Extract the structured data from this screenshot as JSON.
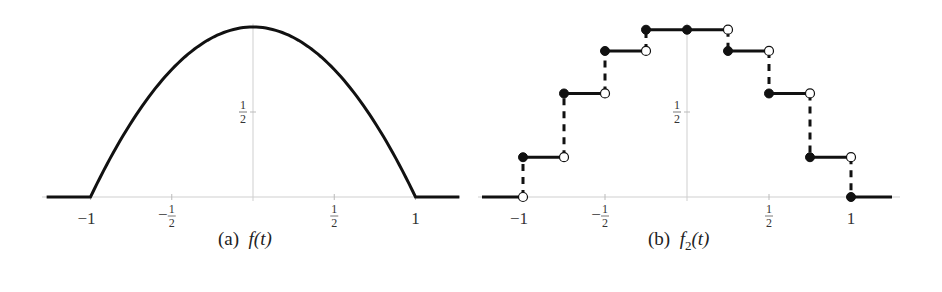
{
  "chart_data": [
    {
      "type": "line",
      "title": "(a) f(t)",
      "caption_label": "(a)",
      "caption_func": "f(t)",
      "xlabel": "",
      "ylabel": "",
      "xlim": [
        -1.25,
        1.25
      ],
      "ylim": [
        0,
        1
      ],
      "x_ticks": [
        "−1",
        "−1/2",
        "1/2",
        "1"
      ],
      "x_tick_values": [
        -1,
        -0.5,
        0.5,
        1
      ],
      "y_ticks": [
        "1/2"
      ],
      "y_tick_values": [
        0.5
      ],
      "grid": false,
      "series": [
        {
          "name": "f(t) = 1 − t² on [−1,1], 0 elsewhere",
          "x": [
            -1.25,
            -1,
            -0.75,
            -0.5,
            -0.25,
            0,
            0.25,
            0.5,
            0.75,
            1,
            1.25
          ],
          "values": [
            0,
            0,
            0.4375,
            0.75,
            0.9375,
            1,
            0.9375,
            0.75,
            0.4375,
            0,
            0
          ]
        }
      ]
    },
    {
      "type": "line",
      "title": "(b) f2(t)",
      "caption_label": "(b)",
      "caption_func": "f",
      "caption_sub": "2",
      "caption_arg": "(t)",
      "xlabel": "",
      "ylabel": "",
      "xlim": [
        -1.25,
        1.25
      ],
      "ylim": [
        0,
        1
      ],
      "x_ticks": [
        "−1",
        "−1/2",
        "1/2",
        "1"
      ],
      "x_tick_values": [
        -1,
        -0.5,
        0.5,
        1
      ],
      "y_ticks": [
        "1/2"
      ],
      "y_tick_values": [
        0.5
      ],
      "grid": false,
      "series": [
        {
          "name": "f2(t) step approximation",
          "steps": [
            {
              "x0": -1.25,
              "x1": -1.0,
              "y": 0
            },
            {
              "x0": -1.0,
              "x1": -0.75,
              "y": 0.234
            },
            {
              "x0": -0.75,
              "x1": -0.5,
              "y": 0.609
            },
            {
              "x0": -0.5,
              "x1": -0.25,
              "y": 0.859
            },
            {
              "x0": -0.25,
              "x1": 0.25,
              "y": 0.984
            },
            {
              "x0": 0.25,
              "x1": 0.5,
              "y": 0.859
            },
            {
              "x0": 0.5,
              "x1": 0.75,
              "y": 0.609
            },
            {
              "x0": 0.75,
              "x1": 1.0,
              "y": 0.234
            },
            {
              "x0": 1.0,
              "x1": 1.25,
              "y": 0
            }
          ]
        }
      ]
    }
  ]
}
